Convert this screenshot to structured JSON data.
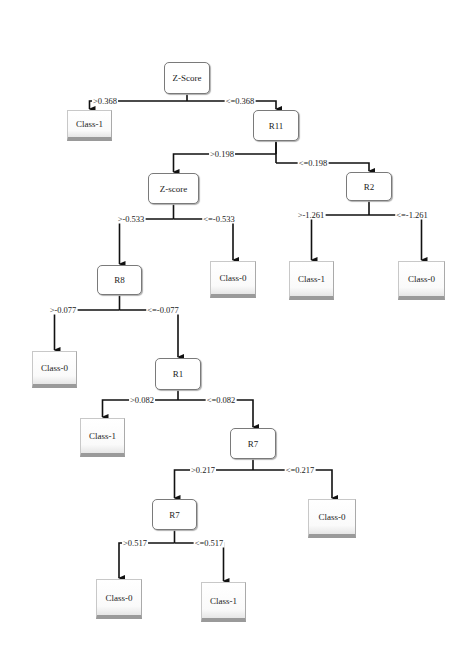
{
  "diagram": {
    "type": "decision-tree",
    "nodes": [
      {
        "id": "n0",
        "label": "Z-Score",
        "kind": "split",
        "x": 164,
        "y": 62,
        "w": 46,
        "h": 32
      },
      {
        "id": "n1",
        "label": "Class-1",
        "kind": "leaf",
        "x": 67,
        "y": 110,
        "w": 45,
        "h": 31
      },
      {
        "id": "n2",
        "label": "R11",
        "kind": "split",
        "x": 253,
        "y": 110,
        "w": 46,
        "h": 31
      },
      {
        "id": "n3",
        "label": "Z-score",
        "kind": "split",
        "x": 148,
        "y": 173,
        "w": 51,
        "h": 31
      },
      {
        "id": "n4",
        "label": "R2",
        "kind": "split",
        "x": 346,
        "y": 172,
        "w": 46,
        "h": 29
      },
      {
        "id": "n5",
        "label": "R8",
        "kind": "split",
        "x": 97,
        "y": 265,
        "w": 45,
        "h": 30
      },
      {
        "id": "n6",
        "label": "Class-0",
        "kind": "leaf",
        "x": 210,
        "y": 261,
        "w": 46,
        "h": 37
      },
      {
        "id": "n7",
        "label": "Class-1",
        "kind": "leaf",
        "x": 289,
        "y": 261,
        "w": 45,
        "h": 39
      },
      {
        "id": "n8",
        "label": "Class-0",
        "kind": "leaf",
        "x": 398,
        "y": 261,
        "w": 47,
        "h": 39
      },
      {
        "id": "n9",
        "label": "Class-0",
        "kind": "leaf",
        "x": 32,
        "y": 351,
        "w": 45,
        "h": 37
      },
      {
        "id": "n10",
        "label": "R1",
        "kind": "split",
        "x": 155,
        "y": 358,
        "w": 46,
        "h": 32
      },
      {
        "id": "n11",
        "label": "Class-1",
        "kind": "leaf",
        "x": 80,
        "y": 418,
        "w": 45,
        "h": 39
      },
      {
        "id": "n12",
        "label": "R7",
        "kind": "split",
        "x": 230,
        "y": 428,
        "w": 46,
        "h": 31
      },
      {
        "id": "n13",
        "label": "R7",
        "kind": "split",
        "x": 152,
        "y": 499,
        "w": 45,
        "h": 31
      },
      {
        "id": "n14",
        "label": "Class-0",
        "kind": "leaf",
        "x": 308,
        "y": 499,
        "w": 48,
        "h": 39
      },
      {
        "id": "n15",
        "label": "Class-0",
        "kind": "leaf",
        "x": 96,
        "y": 579,
        "w": 46,
        "h": 40
      },
      {
        "id": "n16",
        "label": "Class-1",
        "kind": "leaf",
        "x": 201,
        "y": 582,
        "w": 45,
        "h": 40
      }
    ],
    "edges": [
      {
        "from": "n0",
        "to": "n1",
        "label": ">0.368",
        "splitY": 101,
        "labelX": 105
      },
      {
        "from": "n0",
        "to": "n2",
        "label": "<=0.368",
        "splitY": 101,
        "labelX": 240
      },
      {
        "from": "n2",
        "to": "n3",
        "label": ">0.198",
        "splitY": 154,
        "labelX": 222
      },
      {
        "from": "n2",
        "to": "n4",
        "label": "<=0.198",
        "splitY": 163,
        "labelX": 313
      },
      {
        "from": "n3",
        "to": "n5",
        "label": ">-0.533",
        "splitY": 219,
        "labelX": 131
      },
      {
        "from": "n3",
        "to": "n6",
        "label": "<=-0.533",
        "splitY": 219,
        "labelX": 219
      },
      {
        "from": "n4",
        "to": "n7",
        "label": ">-1.261",
        "splitY": 215,
        "labelX": 311
      },
      {
        "from": "n4",
        "to": "n8",
        "label": "<=-1.261",
        "splitY": 215,
        "labelX": 412
      },
      {
        "from": "n5",
        "to": "n9",
        "label": ">-0.077",
        "splitY": 310,
        "labelX": 63
      },
      {
        "from": "n5",
        "to": "n10",
        "label": "<=-0.077",
        "splitY": 310,
        "labelX": 163
      },
      {
        "from": "n10",
        "to": "n11",
        "label": ">0.082",
        "splitY": 400,
        "labelX": 142
      },
      {
        "from": "n10",
        "to": "n12",
        "label": "<=0.082",
        "splitY": 400,
        "labelX": 221
      },
      {
        "from": "n12",
        "to": "n13",
        "label": ">0.217",
        "splitY": 470,
        "labelX": 203
      },
      {
        "from": "n12",
        "to": "n14",
        "label": "<=0.217",
        "splitY": 470,
        "labelX": 300
      },
      {
        "from": "n13",
        "to": "n15",
        "label": ">0.517",
        "splitY": 543,
        "labelX": 135
      },
      {
        "from": "n13",
        "to": "n16",
        "label": "<=0.517",
        "splitY": 543,
        "labelX": 209
      }
    ]
  }
}
